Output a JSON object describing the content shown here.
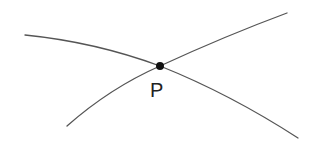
{
  "diagram": {
    "point": {
      "label": "P",
      "x": 160,
      "y": 66,
      "radius": 4,
      "label_x": 150,
      "label_y": 80
    },
    "curves": [
      {
        "name": "curve-a",
        "path": "M 25 35 Q 95 42 160 66 Q 230 94 298 138"
      },
      {
        "name": "curve-b",
        "path": "M 67 126 Q 110 88 160 66 Q 225 36 287 13"
      }
    ],
    "colors": {
      "stroke": "#555555",
      "point": "#111111",
      "label": "#222222",
      "background": "#ffffff"
    }
  }
}
